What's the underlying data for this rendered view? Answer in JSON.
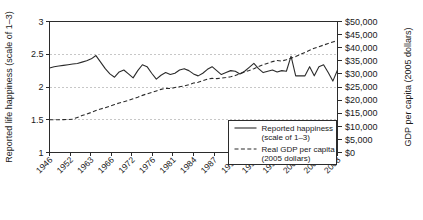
{
  "chart_data": {
    "type": "line",
    "title": "",
    "xlabel": "",
    "ylabel": "Reported life happiness (scale of 1–3)",
    "y2label": "GDP per capita (2005 dollars)",
    "grid": true,
    "legend_position": "bottom-right",
    "x_tick_labels": [
      "1946",
      "1952",
      "1963",
      "1966",
      "1972",
      "1976",
      "1981",
      "1984",
      "1987",
      "1990",
      "1993",
      "1996",
      "2001",
      "2004",
      "2008"
    ],
    "x_tick_rotation_deg": -45,
    "ylim": [
      1,
      3
    ],
    "y_tick_labels": [
      "1",
      "1.5",
      "2",
      "2.5",
      "3"
    ],
    "y_tick_values": [
      1,
      1.5,
      2,
      2.5,
      3
    ],
    "y2lim": [
      0,
      50000
    ],
    "y2_tick_labels": [
      "$0",
      "$5,000",
      "$10,000",
      "$15,000",
      "$20,000",
      "$25,000",
      "$30,000",
      "$35,000",
      "$40,000",
      "$45,000",
      "$50,000"
    ],
    "y2_tick_values": [
      0,
      5000,
      10000,
      15000,
      20000,
      25000,
      30000,
      35000,
      40000,
      45000,
      50000
    ],
    "gridline_values": [
      1.5,
      2,
      2.5
    ],
    "x_index_count": 63,
    "series": [
      {
        "name": "Reported happiness (scale of 1–3)",
        "axis": "left",
        "style": "solid",
        "color": "#2b2b2b",
        "x": [
          0,
          1,
          2,
          3,
          4,
          5,
          6,
          7,
          8,
          9,
          10,
          11,
          12,
          13,
          14,
          15,
          16,
          17,
          18,
          19,
          20,
          21,
          22,
          23,
          24,
          25,
          26,
          27,
          28,
          29,
          30,
          31,
          32,
          33,
          34,
          35,
          36,
          37,
          38,
          39,
          40,
          41,
          42,
          43,
          44,
          45,
          46,
          47,
          48,
          49,
          50,
          51,
          52,
          53,
          54,
          55,
          56,
          57,
          58,
          59,
          60,
          61,
          62
        ],
        "values": [
          2.29,
          2.31,
          2.32,
          2.33,
          2.34,
          2.35,
          2.36,
          2.38,
          2.4,
          2.43,
          2.48,
          2.38,
          2.28,
          2.2,
          2.15,
          2.23,
          2.26,
          2.2,
          2.14,
          2.25,
          2.34,
          2.31,
          2.21,
          2.12,
          2.18,
          2.22,
          2.19,
          2.21,
          2.26,
          2.28,
          2.25,
          2.2,
          2.17,
          2.21,
          2.27,
          2.31,
          2.25,
          2.19,
          2.22,
          2.25,
          2.24,
          2.2,
          2.24,
          2.3,
          2.36,
          2.28,
          2.22,
          2.24,
          2.26,
          2.23,
          2.25,
          2.24,
          2.47,
          2.17,
          2.17,
          2.17,
          2.31,
          2.17,
          2.31,
          2.34,
          2.22,
          2.09,
          2.26
        ]
      },
      {
        "name": "Real GDP per capita (2005 dollars)",
        "axis": "right",
        "style": "dashed",
        "color": "#2b2b2b",
        "x": [
          0,
          1,
          2,
          3,
          4,
          5,
          6,
          7,
          8,
          9,
          10,
          11,
          12,
          13,
          14,
          15,
          16,
          17,
          18,
          19,
          20,
          21,
          22,
          23,
          24,
          25,
          26,
          27,
          28,
          29,
          30,
          31,
          32,
          33,
          34,
          35,
          36,
          37,
          38,
          39,
          40,
          41,
          42,
          43,
          44,
          45,
          46,
          47,
          48,
          49,
          50,
          51,
          52,
          53,
          54,
          55,
          56,
          57,
          58,
          59,
          60,
          61,
          62
        ],
        "values": [
          12500,
          12500,
          12500,
          12550,
          12600,
          12700,
          13400,
          14100,
          14700,
          15300,
          16000,
          16600,
          17100,
          17700,
          18300,
          18900,
          19400,
          19900,
          20500,
          21100,
          21800,
          22400,
          22900,
          23500,
          24100,
          24500,
          24400,
          24800,
          25100,
          25400,
          25900,
          26500,
          26800,
          27400,
          28000,
          28300,
          28200,
          28400,
          28600,
          28900,
          29400,
          30100,
          30700,
          31300,
          32000,
          32800,
          33500,
          34100,
          34700,
          35100,
          34900,
          35400,
          36000,
          36600,
          37400,
          38200,
          39000,
          39800,
          40400,
          41000,
          41600,
          42200,
          42700
        ]
      }
    ]
  },
  "axes": {
    "left_title": "Reported life happiness (scale of 1–3)",
    "right_title": "GDP per capita (2005 dollars)"
  },
  "legend": {
    "entries": [
      {
        "line1": "Reported happiness",
        "line2": "(scale of 1–3)",
        "style": "solid",
        "name": "reported-happiness"
      },
      {
        "line1": "Real GDP per capita",
        "line2": "(2005 dollars)",
        "style": "dashed",
        "name": "real-gdp-per-capita"
      }
    ]
  },
  "colors": {
    "ink": "#2b2b2b",
    "grid": "#b9b9b9",
    "background": "#ffffff"
  }
}
